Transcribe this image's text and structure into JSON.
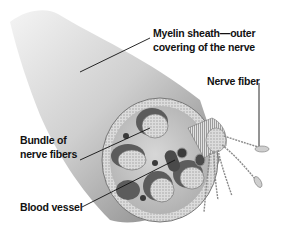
{
  "diagram": {
    "labels": {
      "myelin_line1": "Myelin sheath—outer",
      "myelin_line2": "covering of the nerve",
      "nerve_fiber": "Nerve fiber",
      "bundle_line1": "Bundle of",
      "bundle_line2": "nerve fibers",
      "blood_vessel": "Blood vessel"
    }
  },
  "colors": {
    "background": "#ffffff",
    "sheath_light": "#e6e6e6",
    "sheath_dark": "#8a8a8a",
    "interior": "#c9c9c9",
    "bundle_dark": "#5c5c5c",
    "bundle_face": "#d8d8d8",
    "text": "#111111"
  }
}
